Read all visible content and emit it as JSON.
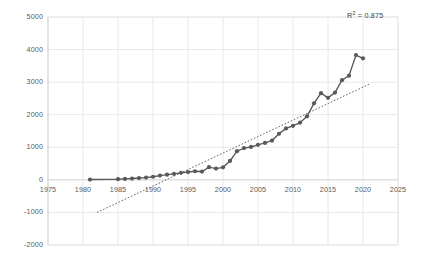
{
  "chart_data": {
    "type": "line",
    "title": "",
    "xlabel": "",
    "ylabel": "",
    "xlim": [
      1975,
      2025
    ],
    "ylim": [
      -2000,
      5000
    ],
    "xticks": [
      1975,
      1980,
      1985,
      1990,
      1995,
      2000,
      2005,
      2010,
      2015,
      2020,
      2025
    ],
    "yticks": [
      5000,
      4000,
      3000,
      2000,
      1000,
      0,
      -1000,
      -2000
    ],
    "grid": true,
    "legend": null,
    "annotations": [
      {
        "name": "r2",
        "text_prefix": "R",
        "text_sup": "2",
        "text_suffix": " = 0.875",
        "value": 0.875
      }
    ],
    "series": [
      {
        "name": "data",
        "style": "line-with-markers",
        "color": "#595959",
        "x": [
          1981,
          1985,
          1986,
          1987,
          1988,
          1989,
          1990,
          1991,
          1992,
          1993,
          1994,
          1995,
          1996,
          1997,
          1998,
          1999,
          2000,
          2001,
          2002,
          2003,
          2004,
          2005,
          2006,
          2007,
          2008,
          2009,
          2010,
          2011,
          2012,
          2013,
          2014,
          2015,
          2016,
          2017,
          2018,
          2019,
          2020
        ],
        "y": [
          10,
          20,
          30,
          40,
          55,
          70,
          95,
          130,
          160,
          185,
          215,
          240,
          265,
          255,
          390,
          345,
          385,
          580,
          880,
          975,
          1010,
          1075,
          1135,
          1205,
          1415,
          1580,
          1660,
          1755,
          1950,
          2350,
          2660,
          2520,
          2680,
          3060,
          3200,
          3830,
          3730
        ]
      },
      {
        "name": "linear-trendline",
        "style": "dotted",
        "color": "#666666",
        "x": [
          1982,
          2021
        ],
        "y": [
          -1000,
          2950
        ]
      }
    ]
  },
  "axis": {
    "y_tick_labels": [
      "5000",
      "4000",
      "3000",
      "2000",
      "1000",
      "0",
      "-1000",
      "-2000"
    ],
    "x_tick_labels": [
      "1975",
      "1980",
      "1985",
      "1990",
      "1995",
      "2000",
      "2005",
      "2010",
      "2015",
      "2020",
      "2025"
    ]
  },
  "colors": {
    "series": "#595959",
    "trendline": "#666666",
    "grid": "#e8e8e8",
    "axis_text": "#5a5a5a",
    "background": "#ffffff"
  }
}
